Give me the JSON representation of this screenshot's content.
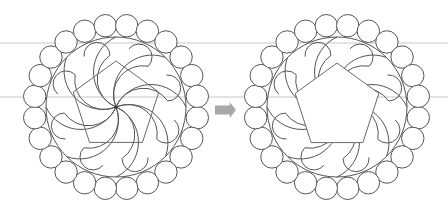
{
  "canvas": {
    "width": 448,
    "height": 215,
    "background": "#ffffff"
  },
  "guide_lines": [
    {
      "y": 43,
      "color": "#c8c8c8"
    },
    {
      "y": 97,
      "color": "#c8c8c8"
    }
  ],
  "figures": [
    {
      "name": "before",
      "center": [
        116,
        107
      ],
      "main_circle_radius": 70,
      "bead_ring": {
        "count": 24,
        "ring_radius": 82,
        "bead_radius": 11.2,
        "angle_offset_deg": 7.5
      },
      "swirl": {
        "arms": 8,
        "lobe_radius": 13,
        "rotation_deg": 0
      },
      "pentagon": {
        "circumradius": 45,
        "center": [
          116,
          106
        ],
        "rotation_deg": -90,
        "filled": false
      },
      "show_center_dot": true
    },
    {
      "name": "after",
      "center": [
        337,
        107
      ],
      "main_circle_radius": 70,
      "bead_ring": {
        "count": 24,
        "ring_radius": 82,
        "bead_radius": 11.2,
        "angle_offset_deg": 7.5
      },
      "swirl": {
        "arms": 8,
        "lobe_radius": 13,
        "rotation_deg": 0
      },
      "pentagon": {
        "circumradius": 44,
        "center": [
          337,
          107
        ],
        "rotation_deg": -90,
        "filled": true
      },
      "show_center_dot": false
    }
  ],
  "arrow": {
    "x": 215,
    "y": 102,
    "width": 21,
    "height": 16,
    "color": "#a8a8a8",
    "direction": "right"
  },
  "colors": {
    "stroke": "#555555",
    "pentagon_stroke": "#6a6a6a"
  }
}
